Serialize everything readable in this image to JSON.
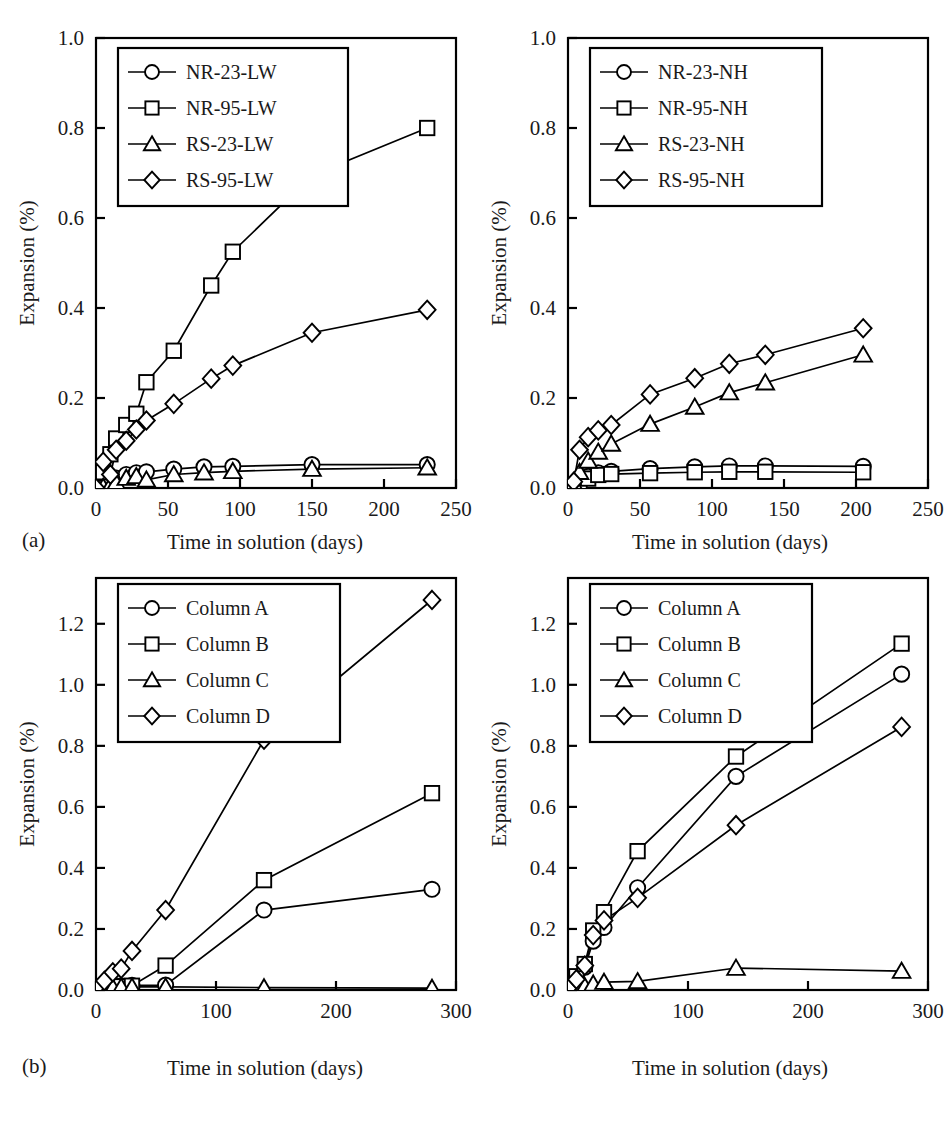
{
  "figure": {
    "panel_a_label": "(a)",
    "panel_b_label": "(b)",
    "axis_x_title": "Time in solution (days)",
    "axis_y_title": "Expansion (%)"
  },
  "chart_data": [
    {
      "id": "a-left",
      "type": "line",
      "title": "",
      "xlabel": "Time in solution (days)",
      "ylabel": "Expansion (%)",
      "xlim": [
        0,
        250
      ],
      "ylim": [
        0,
        1.0
      ],
      "xticks": [
        0,
        50,
        100,
        150,
        200,
        250
      ],
      "xticklabels": [
        "0",
        "50",
        "100",
        "150",
        "200",
        "250"
      ],
      "yticks": [
        0.0,
        0.2,
        0.4,
        0.6,
        0.8,
        1.0
      ],
      "yticklabels": [
        "0.0",
        "0.2",
        "0.4",
        "0.6",
        "0.8",
        "1.0"
      ],
      "grid": false,
      "legend_position": "upper-left",
      "series": [
        {
          "name": "NR-23-LW",
          "marker": "circle",
          "x": [
            0,
            5,
            10,
            14,
            21,
            28,
            35,
            54,
            75,
            95,
            150,
            230
          ],
          "y": [
            0.0,
            0.005,
            0.012,
            0.022,
            0.03,
            0.034,
            0.036,
            0.042,
            0.047,
            0.048,
            0.052,
            0.052
          ]
        },
        {
          "name": "NR-95-LW",
          "marker": "square",
          "x": [
            0,
            5,
            10,
            14,
            21,
            28,
            35,
            54,
            80,
            95,
            150,
            230
          ],
          "y": [
            0.0,
            0.035,
            0.075,
            0.11,
            0.14,
            0.165,
            0.235,
            0.305,
            0.45,
            0.525,
            0.695,
            0.8
          ]
        },
        {
          "name": "RS-23-LW",
          "marker": "triangle",
          "x": [
            0,
            5,
            10,
            14,
            21,
            28,
            35,
            54,
            75,
            95,
            150,
            230
          ],
          "y": [
            0.0,
            0.002,
            0.006,
            0.012,
            0.022,
            0.026,
            0.018,
            0.03,
            0.034,
            0.037,
            0.042,
            0.045
          ]
        },
        {
          "name": "RS-95-LW",
          "marker": "diamond",
          "x": [
            0,
            5,
            10,
            14,
            21,
            28,
            35,
            54,
            80,
            95,
            150,
            230
          ],
          "y": [
            0.0,
            0.058,
            0.03,
            0.085,
            0.105,
            0.13,
            0.15,
            0.187,
            0.243,
            0.272,
            0.345,
            0.396
          ]
        }
      ]
    },
    {
      "id": "a-right",
      "type": "line",
      "title": "",
      "xlabel": "Time in solution (days)",
      "ylabel": "Expansion (%)",
      "xlim": [
        0,
        250
      ],
      "ylim": [
        0,
        1.0
      ],
      "xticks": [
        0,
        50,
        100,
        150,
        200,
        250
      ],
      "xticklabels": [
        "0",
        "50",
        "100",
        "150",
        "200",
        "250"
      ],
      "yticks": [
        0.0,
        0.2,
        0.4,
        0.6,
        0.8,
        1.0
      ],
      "yticklabels": [
        "0.0",
        "0.2",
        "0.4",
        "0.6",
        "0.8",
        "1.0"
      ],
      "grid": false,
      "legend_position": "upper-left",
      "series": [
        {
          "name": "NR-23-NH",
          "marker": "circle",
          "x": [
            0,
            4,
            8,
            14,
            21,
            30,
            57,
            88,
            112,
            137,
            205
          ],
          "y": [
            0.0,
            0.005,
            0.012,
            0.026,
            0.034,
            0.037,
            0.043,
            0.047,
            0.049,
            0.049,
            0.048
          ]
        },
        {
          "name": "NR-95-NH",
          "marker": "square",
          "x": [
            0,
            4,
            8,
            14,
            21,
            30,
            57,
            88,
            112,
            137,
            205
          ],
          "y": [
            0.0,
            0.004,
            0.01,
            0.021,
            0.029,
            0.031,
            0.033,
            0.035,
            0.036,
            0.036,
            0.035
          ]
        },
        {
          "name": "RS-23-NH",
          "marker": "triangle",
          "x": [
            0,
            4,
            8,
            14,
            21,
            30,
            57,
            88,
            112,
            137,
            205
          ],
          "y": [
            0.0,
            0.01,
            0.035,
            0.06,
            0.08,
            0.098,
            0.142,
            0.18,
            0.212,
            0.234,
            0.296
          ]
        },
        {
          "name": "RS-95-NH",
          "marker": "diamond",
          "x": [
            0,
            4,
            8,
            14,
            21,
            30,
            57,
            88,
            112,
            137,
            205
          ],
          "y": [
            0.0,
            0.014,
            0.085,
            0.113,
            0.128,
            0.14,
            0.208,
            0.244,
            0.276,
            0.296,
            0.355
          ]
        }
      ]
    },
    {
      "id": "b-left",
      "type": "line",
      "title": "",
      "xlabel": "Time in solution (days)",
      "ylabel": "Expansion (%)",
      "xlim": [
        0,
        300
      ],
      "ylim": [
        0,
        1.35
      ],
      "xticks": [
        0,
        100,
        200,
        300
      ],
      "xticklabels": [
        "0",
        "100",
        "200",
        "300"
      ],
      "yticks": [
        0.0,
        0.2,
        0.4,
        0.6,
        0.8,
        1.0,
        1.2
      ],
      "yticklabels": [
        "0.0",
        "0.2",
        "0.4",
        "0.6",
        "0.8",
        "1.0",
        "1.2"
      ],
      "grid": false,
      "legend_position": "upper-left",
      "series": [
        {
          "name": "Column A",
          "marker": "circle",
          "x": [
            0,
            7,
            14,
            21,
            30,
            58,
            140,
            280
          ],
          "y": [
            0.005,
            0.01,
            0.012,
            0.014,
            0.015,
            0.016,
            0.262,
            0.33
          ]
        },
        {
          "name": "Column B",
          "marker": "square",
          "x": [
            0,
            7,
            14,
            21,
            30,
            58,
            140,
            280
          ],
          "y": [
            0.005,
            0.008,
            0.01,
            0.012,
            0.014,
            0.08,
            0.36,
            0.645
          ]
        },
        {
          "name": "Column C",
          "marker": "triangle",
          "x": [
            0,
            7,
            14,
            21,
            30,
            58,
            140,
            280
          ],
          "y": [
            0.004,
            0.006,
            0.008,
            0.01,
            0.01,
            0.01,
            0.008,
            0.006
          ]
        },
        {
          "name": "Column D",
          "marker": "diamond",
          "x": [
            0,
            7,
            14,
            21,
            30,
            58,
            140,
            280
          ],
          "y": [
            0.008,
            0.03,
            0.058,
            0.07,
            0.128,
            0.262,
            0.82,
            1.278
          ]
        }
      ]
    },
    {
      "id": "b-right",
      "type": "line",
      "title": "",
      "xlabel": "Time in solution (days)",
      "ylabel": "Expansion (%)",
      "xlim": [
        0,
        300
      ],
      "ylim": [
        0,
        1.35
      ],
      "xticks": [
        0,
        100,
        200,
        300
      ],
      "xticklabels": [
        "0",
        "100",
        "200",
        "300"
      ],
      "yticks": [
        0.0,
        0.2,
        0.4,
        0.6,
        0.8,
        1.0,
        1.2
      ],
      "yticklabels": [
        "0.0",
        "0.2",
        "0.4",
        "0.6",
        "0.8",
        "1.0",
        "1.2"
      ],
      "grid": false,
      "legend_position": "upper-left",
      "series": [
        {
          "name": "Column A",
          "marker": "circle",
          "x": [
            0,
            7,
            14,
            21,
            30,
            58,
            140,
            278
          ],
          "y": [
            0.005,
            0.04,
            0.075,
            0.16,
            0.205,
            0.335,
            0.7,
            1.035
          ]
        },
        {
          "name": "Column B",
          "marker": "square",
          "x": [
            0,
            7,
            14,
            21,
            30,
            58,
            140,
            278
          ],
          "y": [
            0.005,
            0.045,
            0.085,
            0.195,
            0.255,
            0.455,
            0.765,
            1.135
          ]
        },
        {
          "name": "Column C",
          "marker": "triangle",
          "x": [
            0,
            7,
            14,
            21,
            30,
            58,
            140,
            278
          ],
          "y": [
            0.004,
            0.008,
            0.012,
            0.02,
            0.026,
            0.028,
            0.072,
            0.062
          ]
        },
        {
          "name": "Column D",
          "marker": "diamond",
          "x": [
            0,
            7,
            14,
            21,
            30,
            58,
            140,
            278
          ],
          "y": [
            0.005,
            0.035,
            0.08,
            0.18,
            0.228,
            0.302,
            0.54,
            0.862
          ]
        }
      ]
    }
  ]
}
